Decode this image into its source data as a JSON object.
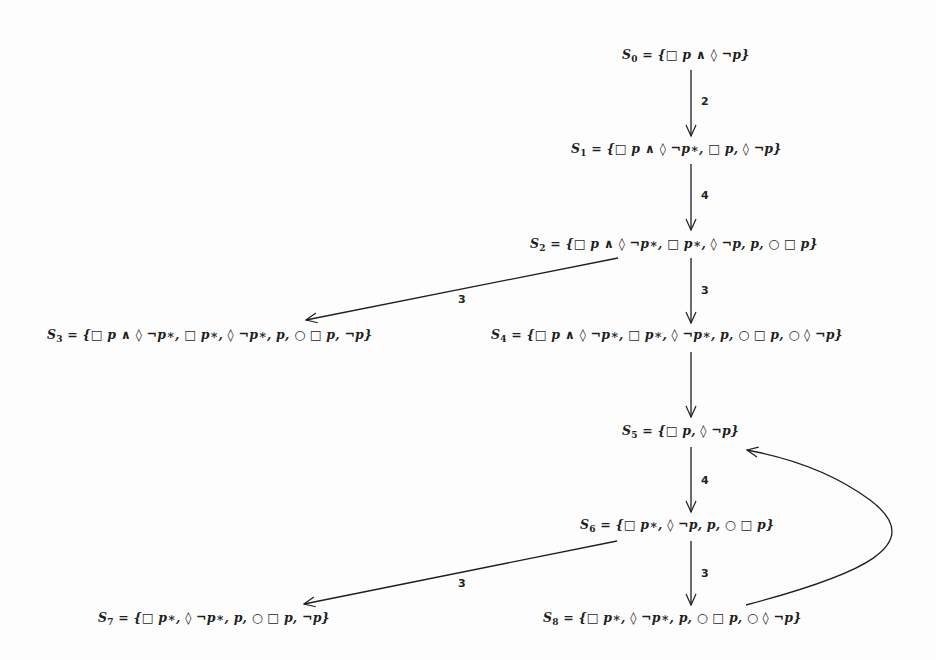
{
  "diagram": {
    "type": "state-transition-tableau",
    "nodes": [
      {
        "id": "S0",
        "name": "S",
        "sub": "0",
        "formula": " = {□ p ∧ ◊ ¬p}"
      },
      {
        "id": "S1",
        "name": "S",
        "sub": "1",
        "formula": " = {□ p ∧ ◊ ¬p∗, □ p, ◊ ¬p}"
      },
      {
        "id": "S2",
        "name": "S",
        "sub": "2",
        "formula": " = {□ p ∧ ◊ ¬p∗, □ p∗, ◊ ¬p, p, ○ □ p}"
      },
      {
        "id": "S3",
        "name": "S",
        "sub": "3",
        "formula": " = {□ p ∧ ◊ ¬p∗, □ p∗, ◊ ¬p∗, p, ○ □ p, ¬p}"
      },
      {
        "id": "S4",
        "name": "S",
        "sub": "4",
        "formula": " = {□ p ∧ ◊ ¬p∗, □ p∗, ◊ ¬p∗, p, ○ □ p, ○ ◊ ¬p}"
      },
      {
        "id": "S5",
        "name": "S",
        "sub": "5",
        "formula": " = {□ p, ◊ ¬p}"
      },
      {
        "id": "S6",
        "name": "S",
        "sub": "6",
        "formula": " = {□ p∗, ◊ ¬p, p, ○ □ p}"
      },
      {
        "id": "S7",
        "name": "S",
        "sub": "7",
        "formula": " = {□ p∗, ◊ ¬p∗, p, ○ □ p, ¬p}"
      },
      {
        "id": "S8",
        "name": "S",
        "sub": "8",
        "formula": " = {□ p∗, ◊ ¬p∗, p, ○ □ p, ○ ◊ ¬p}"
      }
    ],
    "edges": [
      {
        "from": "S0",
        "to": "S1",
        "label": "2"
      },
      {
        "from": "S1",
        "to": "S2",
        "label": "4"
      },
      {
        "from": "S2",
        "to": "S3",
        "label": "3"
      },
      {
        "from": "S2",
        "to": "S4",
        "label": "3"
      },
      {
        "from": "S4",
        "to": "S5",
        "label": ""
      },
      {
        "from": "S5",
        "to": "S6",
        "label": "4"
      },
      {
        "from": "S6",
        "to": "S7",
        "label": "3"
      },
      {
        "from": "S6",
        "to": "S8",
        "label": "3"
      },
      {
        "from": "S8",
        "to": "S5",
        "label": "",
        "style": "curved"
      }
    ],
    "colors": {
      "ink": "#1e1e1e",
      "background": "#fdfdfd"
    }
  }
}
